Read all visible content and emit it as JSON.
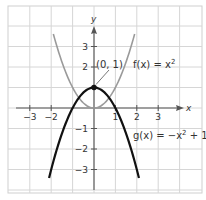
{
  "chart_data": {
    "type": "line",
    "title": "",
    "xlabel": "x",
    "ylabel": "y",
    "xlim": [
      -4,
      5
    ],
    "ylim": [
      -4,
      5
    ],
    "grid": true,
    "x_ticks": [
      -3,
      -2,
      1,
      2,
      3
    ],
    "x_tick_labels": [
      "−3",
      "−2",
      "1",
      "2",
      "3"
    ],
    "y_ticks": [
      3,
      2,
      -1,
      -2,
      -3
    ],
    "y_tick_labels": [
      "3",
      "2",
      "−1",
      "−2",
      "−3"
    ],
    "series": [
      {
        "name": "f(x) = x²",
        "label": "f(x) = x",
        "exponent": "2",
        "color": "#9a9a9a",
        "x": [
          -1.9,
          -1.5,
          -1,
          -0.5,
          0,
          0.5,
          1,
          1.5,
          1.9
        ],
        "y": [
          3.61,
          2.25,
          1,
          0.25,
          0,
          0.25,
          1,
          2.25,
          3.61
        ]
      },
      {
        "name": "g(x) = −x² + 1",
        "label_pre": "g(x) = −x",
        "exponent": "2",
        "label_post": " + 1",
        "color": "#111111",
        "x": [
          -2.1,
          -1.5,
          -1,
          -0.5,
          0,
          0.5,
          1,
          1.5,
          2.1
        ],
        "y": [
          -3.41,
          -1.25,
          0,
          0.75,
          1,
          0.75,
          0,
          -1.25,
          -3.41
        ]
      }
    ],
    "annotations": [
      {
        "text": "(0, 1)",
        "point": [
          0,
          1
        ]
      }
    ]
  }
}
